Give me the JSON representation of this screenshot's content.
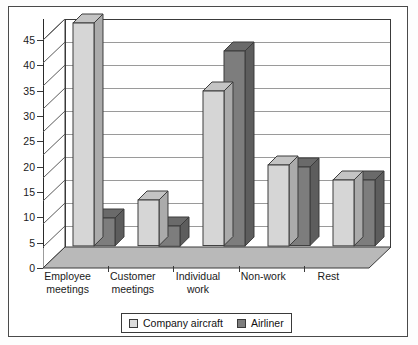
{
  "chart_data": {
    "type": "bar",
    "title": "",
    "subtitle": "",
    "xlabel": "",
    "ylabel": "",
    "categories": [
      "Employee\nmeetings",
      "Customer\nmeetings",
      "Individual\nwork",
      "Non-work",
      "Rest"
    ],
    "series": [
      {
        "name": "Company aircraft",
        "color": "#d6d6d6",
        "values": [
          44,
          9,
          30.5,
          16,
          13
        ]
      },
      {
        "name": "Airliner",
        "color": "#7d7d7d",
        "values": [
          5.5,
          4,
          38.5,
          15.5,
          13
        ]
      }
    ],
    "ylim": [
      0,
      45
    ],
    "yticks": [
      45,
      40,
      35,
      30,
      25,
      20,
      15,
      10,
      5,
      0
    ],
    "ytick_labels": [
      "45",
      "40",
      "35",
      "30",
      "25",
      "20",
      "15",
      "10",
      "5",
      "0"
    ],
    "grid": true,
    "grid_axis": "y",
    "legend_position": "bottom",
    "style": "3d-bar"
  },
  "legend": {
    "items": [
      {
        "label": "Company aircraft",
        "swatch": "light"
      },
      {
        "label": "Airliner",
        "swatch": "dark"
      }
    ]
  }
}
